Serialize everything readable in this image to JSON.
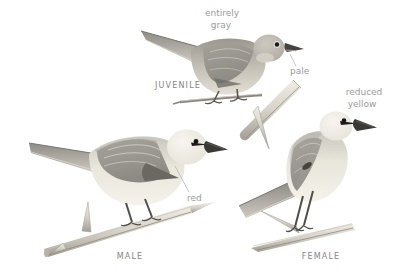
{
  "plate": {
    "type": "bird-field-guide-illustration",
    "background_color": "#ffffff",
    "annotation_color": "#9b9b9b",
    "label_color": "#858585",
    "leader_line_color": "#b8b6b0",
    "birds": [
      {
        "label": "JUVENILE",
        "annotations": [
          "entirely gray",
          "pale"
        ]
      },
      {
        "label": "MALE",
        "annotations": [
          "red"
        ]
      },
      {
        "label": "FEMALE",
        "annotations": [
          "reduced yellow"
        ]
      }
    ]
  },
  "annotations": {
    "entirely": "entirely",
    "gray": "gray",
    "pale": "pale",
    "red": "red",
    "reduced": "reduced",
    "yellow": "yellow"
  },
  "labels": {
    "juvenile": "JUVENILE",
    "male": "MALE",
    "female": "FEMALE"
  }
}
